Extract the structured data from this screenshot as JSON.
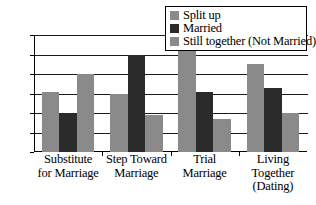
{
  "chart_data": {
    "type": "bar",
    "title": "",
    "subtitle": "",
    "xlabel": "",
    "ylabel": "",
    "ylim": [
      0,
      60
    ],
    "yticks": [
      0,
      10,
      20,
      30,
      40,
      50,
      60
    ],
    "grid": true,
    "legend_position": "top-right",
    "categories": [
      "Substitute for Marriage",
      "Step Toward Marriage",
      "Trial Marriage",
      "Living Together (Dating)"
    ],
    "category_lines": [
      [
        "Substitute",
        "for Marriage"
      ],
      [
        "Step Toward",
        "Marriage"
      ],
      [
        "Trial",
        "Marriage"
      ],
      [
        "Living",
        "Together",
        "(Dating)"
      ]
    ],
    "series": [
      {
        "name": "Split up",
        "color": "#8a8a8a",
        "values": [
          31,
          30,
          52,
          45
        ]
      },
      {
        "name": "Married",
        "color": "#2b2b2b",
        "values": [
          20,
          50,
          31,
          33
        ]
      },
      {
        "name": "Still together (Not Married)",
        "color": "#8a8a8a",
        "values": [
          40,
          19,
          17,
          20
        ]
      }
    ]
  },
  "legend": {
    "items": [
      {
        "label": "Split up"
      },
      {
        "label": "Married"
      },
      {
        "label": "Still together (Not Married)"
      }
    ]
  },
  "colors": {
    "gray": "#8a8a8a",
    "dark": "#2b2b2b",
    "axis": "#000000",
    "grid": "#1a1a1a",
    "background": "#ffffff"
  }
}
